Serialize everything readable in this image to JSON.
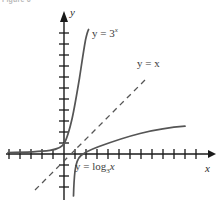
{
  "figure": {
    "caption": "Figure 6",
    "background_color": "#ffffff",
    "axis_color": "#1a1a1a",
    "curve_color": "#555555",
    "dashed_color": "#555555",
    "text_color": "#2b2b2b"
  },
  "axes": {
    "x_axis_label": "x",
    "y_axis_label": "y",
    "origin_px": {
      "x": 64,
      "y": 154
    },
    "tick_spacing_px": 11,
    "x_tick_count_left": 5,
    "x_tick_count_right": 12,
    "y_tick_count_up": 11,
    "y_tick_count_down": 4,
    "arrow_x_end_px": 212,
    "arrow_y_end_px": 14
  },
  "curves": [
    {
      "name": "exponential",
      "label": "y = 3",
      "label_exponent": "x",
      "equation": "y = 3^x",
      "base": 3,
      "style": "solid",
      "color": "#555555",
      "passes_through": [
        [
          0,
          1
        ],
        [
          1,
          3
        ],
        [
          -1,
          0.333
        ]
      ]
    },
    {
      "name": "identity",
      "label": "y = x",
      "equation": "y = x",
      "style": "dashed",
      "color": "#555555",
      "slope": 1,
      "intercept": 0
    },
    {
      "name": "logarithm",
      "label_prefix": "y = log",
      "label_base": "3",
      "label_suffix": "x",
      "equation": "y = log_3 x",
      "base": 3,
      "style": "solid",
      "color": "#555555",
      "passes_through": [
        [
          1,
          0
        ],
        [
          3,
          1
        ],
        [
          0.333,
          -1
        ]
      ]
    }
  ]
}
